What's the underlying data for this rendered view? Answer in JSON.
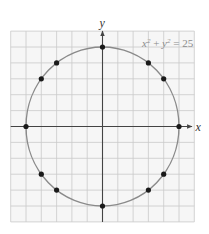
{
  "chart_data": {
    "type": "scatter",
    "title": "",
    "equation": "x^2 + y^2 = 25",
    "xlabel": "x",
    "ylabel": "y",
    "xlim": [
      -6,
      6
    ],
    "ylim": [
      -6,
      6
    ],
    "grid": true,
    "grid_step": 1,
    "legend": null,
    "curve": {
      "type": "circle",
      "center": [
        0,
        0
      ],
      "radius": 5,
      "label": "x^2 + y^2 = 25"
    },
    "points": [
      {
        "x": 0,
        "y": 5
      },
      {
        "x": 3,
        "y": 4
      },
      {
        "x": 4,
        "y": 3
      },
      {
        "x": 5,
        "y": 0
      },
      {
        "x": 4,
        "y": -3
      },
      {
        "x": 3,
        "y": -4
      },
      {
        "x": 0,
        "y": -5
      },
      {
        "x": -3,
        "y": -4
      },
      {
        "x": -4,
        "y": -3
      },
      {
        "x": -5,
        "y": 0
      },
      {
        "x": -4,
        "y": 3
      },
      {
        "x": -3,
        "y": 4
      }
    ]
  },
  "labels": {
    "x_axis": "x",
    "y_axis": "y",
    "equation": {
      "x": "x",
      "plus": " + ",
      "y": "y",
      "exp": "2",
      "equals": " = ",
      "rhs": "25"
    }
  },
  "colors": {
    "grid_background": "#f6f6f6",
    "grid_lines": "#c9c9c9",
    "axes": "#444444",
    "circle": "#8a8a8a",
    "points": "#1a1a1a",
    "equation_text": "#8c8c8c"
  }
}
